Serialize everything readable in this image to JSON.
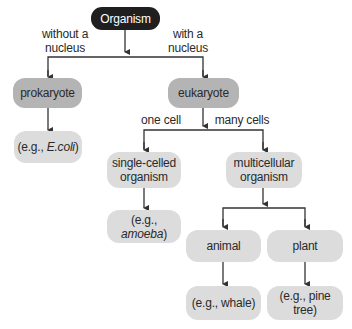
{
  "diagram": {
    "root": "Organism",
    "edge_labels": {
      "without_nucleus": "without a nucleus",
      "with_nucleus": "with a nucleus",
      "one_cell": "one cell",
      "many_cells": "many cells"
    },
    "nodes": {
      "prokaryote": "prokaryote",
      "prokaryote_example_prefix": "(e.g., ",
      "prokaryote_example_italic": "E.coli",
      "prokaryote_example_suffix": ")",
      "eukaryote": "eukaryote",
      "single_celled": "single-celled organism",
      "single_celled_example_prefix": "(e.g.,",
      "single_celled_example_italic": "amoeba",
      "single_celled_example_suffix": ")",
      "multicellular": "multicellular organism",
      "animal": "animal",
      "animal_example": "(e.g., whale)",
      "plant": "plant",
      "plant_example": "(e.g., pine tree)"
    },
    "colors": {
      "root_fill": "#1f1f1f",
      "category_fill": "#b4b4b4",
      "leaf_fill": "#dcdcdc",
      "line": "#333333"
    }
  }
}
